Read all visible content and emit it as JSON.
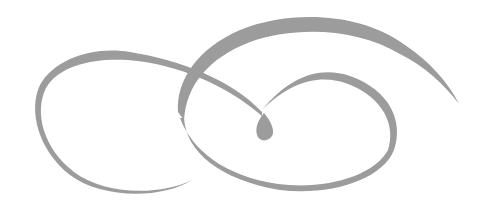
{
  "image": {
    "description": "Decorative gray calligraphic swirl flourish with two interlocking loops and a central teardrop",
    "stroke_color": "#9a9a9a",
    "background": "#ffffff"
  }
}
